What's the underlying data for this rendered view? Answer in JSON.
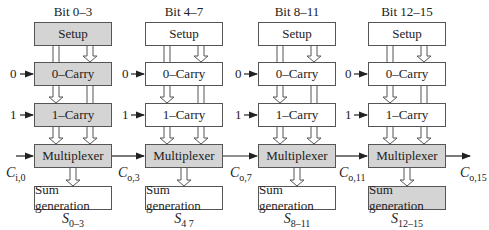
{
  "diagram": {
    "type": "carry-select adder block diagram",
    "colors": {
      "gray_fill": "#d4d4d4",
      "white_fill": "#ffffff",
      "stroke": "#555555",
      "text": "#222222"
    },
    "block_labels": {
      "setup": "Setup",
      "zero_carry": "0–Carry",
      "one_carry": "1–Carry",
      "mux": "Multiplexer",
      "sum": "Sum generation"
    },
    "inputs": {
      "zero": "0",
      "one": "1"
    },
    "columns": [
      {
        "title": "Bit 0–3",
        "sum_base": "S",
        "sum_sub": "0–3",
        "carry_in_base": "C",
        "carry_in_sub": "i,0",
        "carry_out_base": "C",
        "carry_out_sub": "o,3",
        "setup_gray": true,
        "zero_gray": true,
        "one_gray": true,
        "mux_gray": true,
        "sum_gray": false
      },
      {
        "title": "Bit 4–7",
        "sum_base": "S",
        "sum_sub": "4 7",
        "carry_out_base": "C",
        "carry_out_sub": "o,7",
        "setup_gray": false,
        "zero_gray": false,
        "one_gray": false,
        "mux_gray": true,
        "sum_gray": false
      },
      {
        "title": "Bit 8–11",
        "sum_base": "S",
        "sum_sub": "8–11",
        "carry_out_base": "C",
        "carry_out_sub": "o,11",
        "setup_gray": false,
        "zero_gray": false,
        "one_gray": false,
        "mux_gray": true,
        "sum_gray": false
      },
      {
        "title": "Bit 12–15",
        "sum_base": "S",
        "sum_sub": "12–15",
        "carry_out_base": "C",
        "carry_out_sub": "o,15",
        "setup_gray": false,
        "zero_gray": false,
        "one_gray": false,
        "mux_gray": true,
        "sum_gray": true
      }
    ]
  }
}
